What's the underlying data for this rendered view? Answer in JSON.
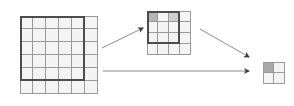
{
  "figure": {
    "background_color": "#ffffff",
    "width": 294,
    "height": 106,
    "grid_line_color": "#9a9a9a",
    "roi_border_color": "#4d4d4d",
    "cell_fill_color": "#f4f4f4",
    "arrow_color": "#8c8c8c",
    "arrow_head_color": "#3c3c3c"
  },
  "grids": [
    {
      "id": "large-grid",
      "label": "Level 0 grid",
      "cols": 6,
      "rows": 6,
      "x": 20,
      "y": 16,
      "cell_size": 13,
      "roi": {
        "col": 0,
        "row": 0,
        "cols": 5,
        "rows": 5
      },
      "shaded_cells": []
    },
    {
      "id": "medium-grid",
      "label": "Level 1 grid",
      "cols": 4,
      "rows": 4,
      "x": 147,
      "y": 11,
      "cell_size": 11,
      "roi": {
        "col": 0,
        "row": 0,
        "cols": 3,
        "rows": 3
      },
      "shaded_cells": [
        {
          "col": 0,
          "row": 0,
          "color": "#b4b4b4"
        },
        {
          "col": 2,
          "row": 0,
          "color": "#cfcfcf"
        }
      ]
    },
    {
      "id": "small-grid",
      "label": "Level 2 grid",
      "cols": 2,
      "rows": 2,
      "x": 263,
      "y": 62,
      "cell_size": 11,
      "roi": null,
      "shaded_cells": [
        {
          "col": 0,
          "row": 0,
          "color": "#a8a8a8"
        }
      ]
    }
  ],
  "arrows": [
    {
      "id": "arrow-large-to-medium",
      "label": "downsample large grid to medium grid",
      "x1": 102,
      "y1": 48,
      "x2": 143,
      "y2": 28
    },
    {
      "id": "arrow-medium-to-small",
      "label": "downsample medium grid to small grid",
      "x1": 200,
      "y1": 29,
      "x2": 249,
      "y2": 57
    },
    {
      "id": "arrow-large-to-small",
      "label": "direct downsample large grid to small grid",
      "x1": 103,
      "y1": 71,
      "x2": 249,
      "y2": 71
    }
  ]
}
